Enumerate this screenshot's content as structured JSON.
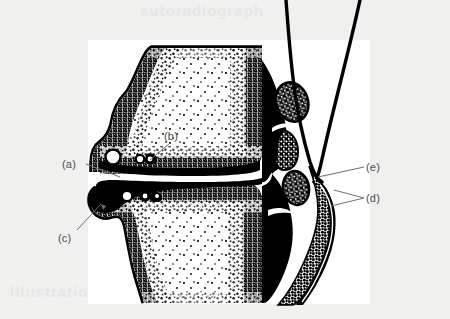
{
  "figure": {
    "width": 450,
    "height": 319,
    "background_color": "#f0f0ef",
    "plate_color": "#ffffff",
    "ink_color": "#000000",
    "label_color": "#4c4c4c"
  },
  "ghost_text": {
    "top": "autoradiograph",
    "bottom": "illustration",
    "bottom_right": "section"
  },
  "labels": [
    {
      "key": "a",
      "text": "(a)"
    },
    {
      "key": "b",
      "text": "(b)"
    },
    {
      "key": "c",
      "text": "(c)"
    },
    {
      "key": "d",
      "text": "(d)"
    },
    {
      "key": "e",
      "text": "(e)"
    }
  ],
  "leaders": [
    {
      "for": "a",
      "from": [
        86,
        164
      ],
      "to": [
        118,
        176
      ],
      "arrow": false
    },
    {
      "for": "b",
      "from": [
        168,
        142
      ],
      "to": [
        148,
        160
      ],
      "arrow": false
    },
    {
      "for": "c",
      "from": [
        76,
        231
      ],
      "to": [
        102,
        203
      ],
      "arrow": true
    },
    {
      "for": "d",
      "from": [
        364,
        198
      ],
      "to": [
        330,
        205
      ],
      "arrow": false
    },
    {
      "for": "d2",
      "from": [
        364,
        198
      ],
      "to": [
        333,
        191
      ],
      "arrow": false
    },
    {
      "for": "e",
      "from": [
        364,
        167
      ],
      "to": [
        320,
        176
      ],
      "arrow": false
    }
  ],
  "icon_names": {
    "leader_line": "leader-line-icon",
    "arrow_head": "arrowhead-icon"
  }
}
